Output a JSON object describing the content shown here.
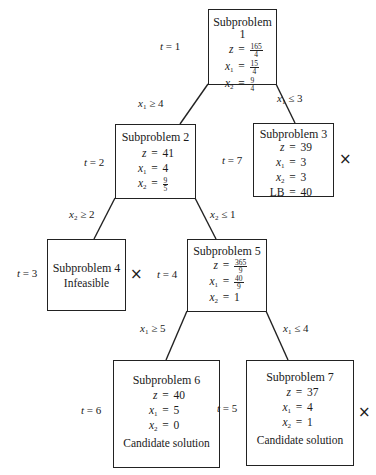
{
  "diagram": {
    "type": "branch-and-bound tree",
    "nodes": [
      {
        "id": "sp1",
        "title": "Subproblem 1",
        "t": "1",
        "z": {
          "num": "165",
          "den": "4"
        },
        "x1": {
          "num": "15",
          "den": "4"
        },
        "x2": {
          "num": "9",
          "den": "4"
        },
        "status": "",
        "fathomed": false
      },
      {
        "id": "sp2",
        "title": "Subproblem 2",
        "t": "2",
        "z": "41",
        "x1": "4",
        "x2": {
          "num": "9",
          "den": "5"
        },
        "status": "",
        "fathomed": false
      },
      {
        "id": "sp3",
        "title": "Subproblem 3",
        "t": "7",
        "z": "39",
        "x1": "3",
        "x2": "3",
        "lb_label": "LB",
        "lb": "40",
        "fathomed": true
      },
      {
        "id": "sp4",
        "title": "Subproblem 4",
        "t": "3",
        "status": "Infeasible",
        "fathomed": true
      },
      {
        "id": "sp5",
        "title": "Subproblem 5",
        "t": "4",
        "z": {
          "num": "365",
          "den": "9"
        },
        "x1": {
          "num": "40",
          "den": "9"
        },
        "x2": "1",
        "fathomed": false
      },
      {
        "id": "sp6",
        "title": "Subproblem 6",
        "t": "6",
        "z": "40",
        "x1": "5",
        "x2": "0",
        "status": "Candidate solution",
        "fathomed": false
      },
      {
        "id": "sp7",
        "title": "Subproblem 7",
        "t": "5",
        "z": "37",
        "x1": "4",
        "x2": "1",
        "status": "Candidate solution",
        "fathomed": true
      }
    ],
    "edges": [
      {
        "from": "sp1",
        "to": "sp2",
        "var": "x",
        "sub": "1",
        "op": "≥",
        "value": "4"
      },
      {
        "from": "sp1",
        "to": "sp3",
        "var": "x",
        "sub": "1",
        "op": "≤",
        "value": "3"
      },
      {
        "from": "sp2",
        "to": "sp4",
        "var": "x",
        "sub": "2",
        "op": "≥",
        "value": "2"
      },
      {
        "from": "sp2",
        "to": "sp5",
        "var": "x",
        "sub": "2",
        "op": "≤",
        "value": "1"
      },
      {
        "from": "sp5",
        "to": "sp6",
        "var": "x",
        "sub": "1",
        "op": "≥",
        "value": "5"
      },
      {
        "from": "sp5",
        "to": "sp7",
        "var": "x",
        "sub": "1",
        "op": "≤",
        "value": "4"
      }
    ],
    "labels": {
      "t_prefix": "t",
      "eq": "=",
      "t7_eq": "=",
      "t5_eq": "=",
      "fathom_mark": "×",
      "z": "z",
      "x": "x",
      "sub1": "1",
      "sub2": "2"
    }
  }
}
